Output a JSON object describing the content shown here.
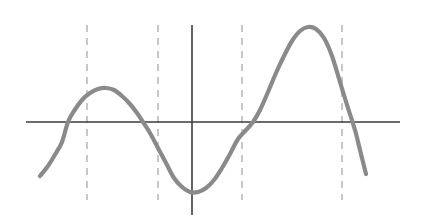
{
  "figure": {
    "title": "",
    "background_color": "#ffffff",
    "width": 421,
    "height": 221
  },
  "chart_data": {
    "type": "line",
    "title": "",
    "subtitle": "",
    "xlabel": "",
    "ylabel": "",
    "tick_labels_x": [],
    "tick_labels_y": [],
    "legend": [],
    "annotations": [],
    "grid": false,
    "axis_style": {
      "x_axis_color": "#3b3b3b",
      "y_axis_color": "#3b3b3b",
      "x_axis_width": 1.6,
      "y_axis_width": 1.6,
      "x_axis_y_pixel": 122,
      "y_axis_x_pixel": 192,
      "x_axis_span_pixels": [
        26,
        400
      ],
      "y_axis_span_pixels": [
        25,
        215
      ]
    },
    "curve": {
      "name": "smooth-wave-curve",
      "color": "#8a8a8a",
      "stroke_width": 4.2,
      "description": "Smooth continuous wave: rises from lower left, local maximum, dips below axis, deep local minimum near origin, rises to global maximum, then falls steeply off to lower right.",
      "points_pixels": [
        [
          40,
          176
        ],
        [
          48,
          166
        ],
        [
          56,
          153
        ],
        [
          62,
          142
        ],
        [
          68,
          122
        ],
        [
          74,
          111
        ],
        [
          82,
          100
        ],
        [
          90,
          93
        ],
        [
          98,
          89
        ],
        [
          106,
          88
        ],
        [
          114,
          90
        ],
        [
          122,
          96
        ],
        [
          130,
          104
        ],
        [
          137,
          113
        ],
        [
          143,
          122
        ],
        [
          150,
          133
        ],
        [
          158,
          148
        ],
        [
          166,
          163
        ],
        [
          174,
          178
        ],
        [
          182,
          187
        ],
        [
          190,
          192
        ],
        [
          198,
          192
        ],
        [
          206,
          188
        ],
        [
          214,
          180
        ],
        [
          222,
          168
        ],
        [
          230,
          154
        ],
        [
          238,
          139
        ],
        [
          246,
          130
        ],
        [
          253,
          122
        ],
        [
          260,
          110
        ],
        [
          268,
          92
        ],
        [
          276,
          73
        ],
        [
          284,
          56
        ],
        [
          292,
          41
        ],
        [
          300,
          31
        ],
        [
          308,
          27
        ],
        [
          316,
          29
        ],
        [
          324,
          38
        ],
        [
          332,
          56
        ],
        [
          340,
          82
        ],
        [
          348,
          108
        ],
        [
          355,
          130
        ],
        [
          360,
          150
        ],
        [
          366,
          174
        ]
      ],
      "x_axis_crossings_pixels": [
        68,
        143,
        253,
        355
      ],
      "local_maximum_pixels": [
        106,
        88
      ],
      "local_minimum_pixels": [
        194,
        192
      ],
      "global_maximum_pixels": [
        308,
        27
      ],
      "start_point_pixels": [
        40,
        176
      ],
      "end_point_pixels": [
        366,
        174
      ]
    },
    "dashed_lines": {
      "name": "dashed-vertical-guides",
      "color": "#b7b7b7",
      "stroke_width": 1.5,
      "dash_pattern": "7 6",
      "y_top_pixel": 25,
      "y_bottom_pixel": 200,
      "x_positions_pixels": [
        87,
        158,
        242,
        342
      ]
    }
  }
}
